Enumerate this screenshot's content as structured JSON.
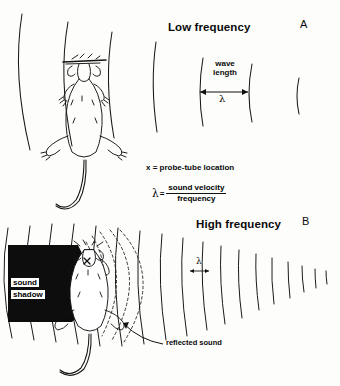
{
  "figure": {
    "background_color": "#fdfdfc",
    "ink_color": "#111111"
  },
  "panel_a": {
    "letter": "A",
    "title": "Low frequency",
    "wave_caption_line1": "wave",
    "wave_caption_line2": "length",
    "lambda_symbol": "λ",
    "subject": "mouse-top-view",
    "wavefront_count": 6,
    "wavefront_style": "solid"
  },
  "panel_b": {
    "letter": "B",
    "title": "High frequency",
    "lambda_symbol": "λ",
    "shadow_label_line1": "sound",
    "shadow_label_line2": "shadow",
    "reflected_label": "reflected sound",
    "subject": "mouse-top-view",
    "wavefront_count": 13,
    "wavefront_style": "solid",
    "reflected_style": "dashed"
  },
  "annotations": {
    "probe_note": "x = probe-tube location",
    "formula_lambda": "λ",
    "formula_equals": "=",
    "formula_numerator": "sound velocity",
    "formula_denominator": "frequency"
  }
}
